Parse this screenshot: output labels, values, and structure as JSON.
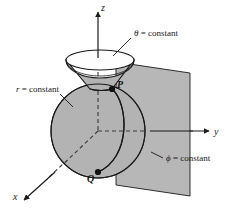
{
  "figure": {
    "background_color": "#ffffff",
    "stroke_color": "#1a1a1a",
    "surface_fill": "#b3b3b3",
    "cone_top_fill": "#ffffff",
    "axes": [
      {
        "id": "z",
        "label": "z",
        "direction": "up"
      },
      {
        "id": "y",
        "label": "y",
        "direction": "right"
      },
      {
        "id": "x",
        "label": "x",
        "direction": "down-left"
      }
    ],
    "surfaces": [
      {
        "id": "sphere",
        "label": "r = constant",
        "symbol": "r",
        "equals": "= constant"
      },
      {
        "id": "cone",
        "label": "θ = constant",
        "symbol": "θ",
        "equals": "= constant"
      },
      {
        "id": "halfplane",
        "label": "ϕ = constant",
        "symbol": "ϕ",
        "equals": "= constant"
      }
    ],
    "points": [
      {
        "id": "P",
        "label": "P"
      },
      {
        "id": "Q",
        "label": "Q"
      }
    ],
    "labels": {
      "theta_symbol": "θ",
      "theta_rest": " = constant",
      "theta_full": "θ = constant",
      "r_symbol": "r",
      "r_rest": " = constant",
      "r_full": "r = constant",
      "phi_symbol": "ϕ",
      "phi_rest": " = constant",
      "phi_full": "ϕ = constant",
      "axis_z": "z",
      "axis_y": "y",
      "axis_x": "x",
      "point_p": "P",
      "point_q": "Q"
    }
  }
}
